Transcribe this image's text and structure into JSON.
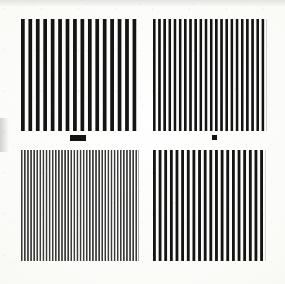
{
  "document": {
    "title": "Line-Pair Resolution Test Target",
    "kind": "four-quadrant vertical bar pattern",
    "sheet_width": 285,
    "sheet_height": 284,
    "background_color": "#fbfbf9",
    "ink_color": "#121212"
  },
  "chart_data": {
    "type": "bar",
    "subtitle": "Four quadrants of vertical black bars at increasing spatial frequency",
    "xlabel": "",
    "ylabel": "",
    "grid": false,
    "legend": "none",
    "categories": [
      "top-left",
      "top-right",
      "bottom-left",
      "bottom-right"
    ],
    "values": [
      16,
      22,
      38,
      20
    ],
    "series": [
      {
        "name": "bar_count",
        "values": [
          16,
          22,
          38,
          20
        ]
      },
      {
        "name": "period_px",
        "values": [
          7.5,
          5.4,
          3.1,
          6.0
        ]
      },
      {
        "name": "bar_width_px",
        "values": [
          3.6,
          2.3,
          1.5,
          2.6
        ]
      },
      {
        "name": "duty_cycle_pct",
        "values": [
          48,
          43,
          48,
          43
        ]
      },
      {
        "name": "ink_density_pct",
        "values": [
          100,
          100,
          78,
          100
        ]
      }
    ],
    "annotations": [
      "black rectangle marker below top-left quadrant",
      "small black square marker below top-right quadrant"
    ]
  },
  "quadrants": [
    {
      "id": "quadrant-top-left",
      "label": "top-left",
      "bar_count": 16,
      "period_px": 7.5,
      "bar_width_px": 3.6,
      "ink_color": "#141414",
      "x": 21,
      "y": 19,
      "width": 119,
      "height": 112
    },
    {
      "id": "quadrant-top-right",
      "label": "top-right",
      "bar_count": 22,
      "period_px": 5.4,
      "bar_width_px": 2.3,
      "ink_color": "#141414",
      "x": 153,
      "y": 19,
      "width": 114,
      "height": 112
    },
    {
      "id": "quadrant-bottom-left",
      "label": "bottom-left",
      "bar_count": 38,
      "period_px": 3.1,
      "bar_width_px": 1.5,
      "ink_color": "#3a3a3a",
      "x": 21,
      "y": 150,
      "width": 118,
      "height": 111
    },
    {
      "id": "quadrant-bottom-right",
      "label": "bottom-right",
      "bar_count": 20,
      "period_px": 6.0,
      "bar_width_px": 2.6,
      "ink_color": "#141414",
      "x": 153,
      "y": 150,
      "width": 113,
      "height": 111
    }
  ],
  "markers": [
    {
      "id": "marker-rectangle",
      "shape": "rectangle",
      "x": 70,
      "y": 135,
      "width": 16,
      "height": 6
    },
    {
      "id": "marker-square",
      "shape": "square",
      "x": 212,
      "y": 135,
      "width": 5,
      "height": 5
    }
  ]
}
